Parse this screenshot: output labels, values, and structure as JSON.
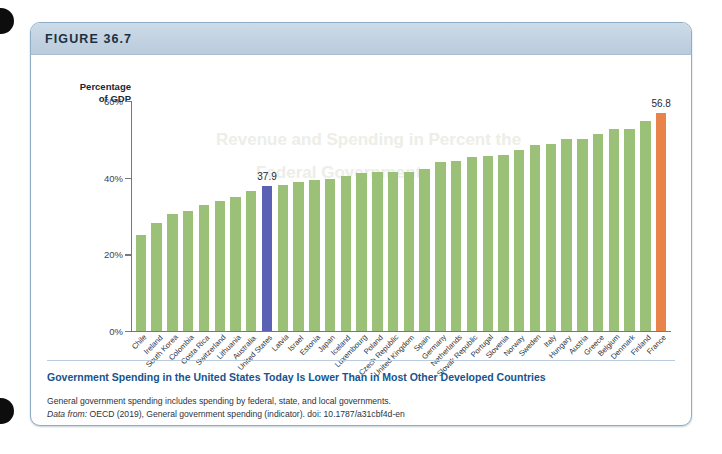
{
  "figure": {
    "number_label": "FIGURE 36.7",
    "ghost_text_1": "Revenue and Spending in Percent the",
    "ghost_text_2": "Federal Government"
  },
  "caption": {
    "title": "Government Spending in the United States Today Is Lower Than in Most Other Developed Countries",
    "note": "General government spending includes spending by federal, state, and local governments.",
    "source_prefix": "Data from:",
    "source_rest": " OECD (2019), General government spending (indicator). doi: 10.1787/a31cbf4d-en"
  },
  "colors": {
    "bar_default": "#9bc178",
    "bar_united_states": "#5b62b5",
    "bar_france": "#e8834a",
    "caption_title": "#17538c",
    "header_band": "#c2d2e1",
    "card_border": "#8fadc4"
  },
  "chart_data": {
    "type": "bar",
    "title": "",
    "xlabel": "",
    "ylabel": "Percentage of GDP",
    "ylabel_line1": "Percentage",
    "ylabel_line2": "of GDP",
    "ylim": [
      0,
      60
    ],
    "yticks": [
      0,
      20,
      40,
      60
    ],
    "ytick_labels": [
      "0%",
      "20%",
      "40%",
      "60%"
    ],
    "grid": false,
    "legend": "none",
    "categories": [
      "Chile",
      "Ireland",
      "South Korea",
      "Colombia",
      "Costa Rica",
      "Switzerland",
      "Lithuania",
      "Australia",
      "United States",
      "Latvia",
      "Israel",
      "Estonia",
      "Japan",
      "Iceland",
      "Luxembourg",
      "Poland",
      "Czech Republic",
      "United Kingdom",
      "Spain",
      "Germany",
      "Netherlands",
      "Slovak Republic",
      "Portugal",
      "Slovenia",
      "Norway",
      "Sweden",
      "Italy",
      "Hungary",
      "Austria",
      "Greece",
      "Belgium",
      "Denmark",
      "Finland",
      "France"
    ],
    "values": [
      25.0,
      28.3,
      30.5,
      31.4,
      33.0,
      33.8,
      34.9,
      36.5,
      37.9,
      38.2,
      38.8,
      39.5,
      39.6,
      40.5,
      41.2,
      41.5,
      41.6,
      41.6,
      42.2,
      44.0,
      44.3,
      45.5,
      45.6,
      46.0,
      47.2,
      48.5,
      48.8,
      50.0,
      50.2,
      51.5,
      52.6,
      52.8,
      54.8,
      56.8
    ],
    "value_labels": {
      "United States": "37.9",
      "France": "56.8"
    },
    "highlighted": [
      "United States",
      "France"
    ]
  }
}
